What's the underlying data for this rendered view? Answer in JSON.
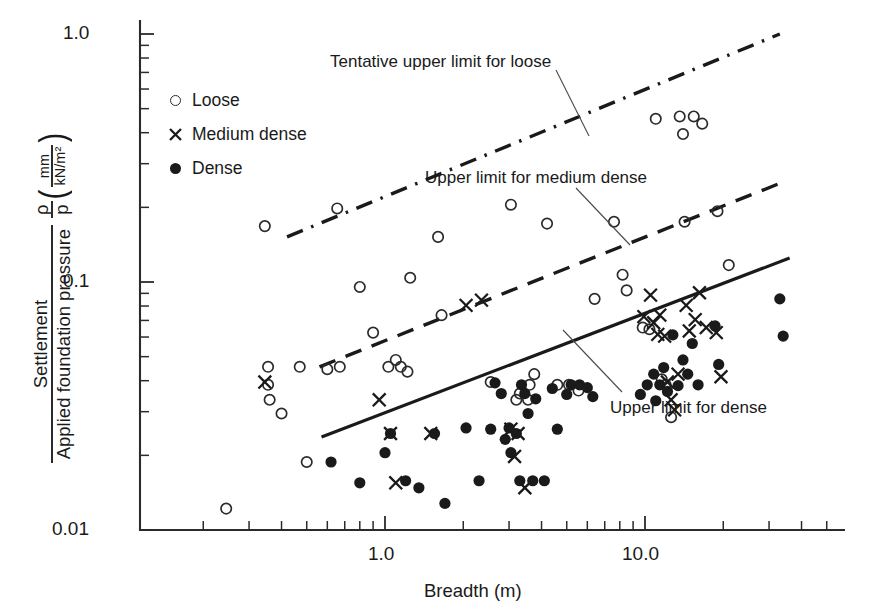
{
  "chart_data": {
    "type": "scatter",
    "title": "",
    "xlabel": "Breadth (m)",
    "ylabel": "Settlement / Applied foundation pressure",
    "ylabel_parts": {
      "numerator": "Settlement",
      "denominator": "Applied foundation pressure",
      "symbol_numerator": "ρ",
      "symbol_denominator": "p",
      "units_numerator": "mm",
      "units_denominator": "kN/m²"
    },
    "xscale": "log",
    "yscale": "log",
    "xlim": [
      0.2,
      50.0
    ],
    "ylim": [
      0.01,
      1.0
    ],
    "xticks": [
      1.0,
      10.0
    ],
    "xticklabels": [
      "1.0",
      "10.0"
    ],
    "yticks": [
      0.01,
      0.1,
      1.0
    ],
    "yticklabels": [
      "0.01",
      "0.1",
      "1.0"
    ],
    "grid": false,
    "legend_position": "upper-left-inside",
    "legend": [
      {
        "label": "Loose",
        "marker": "open-circle"
      },
      {
        "label": "Medium dense",
        "marker": "x"
      },
      {
        "label": "Dense",
        "marker": "filled-circle"
      }
    ],
    "annotations": [
      {
        "text": "Tentative upper limit for loose",
        "target_line": "tentative-upper-limit-loose"
      },
      {
        "text": "Upper limit for medium dense",
        "target_line": "upper-limit-medium-dense"
      },
      {
        "text": "Upper limit for dense",
        "target_line": "upper-limit-dense"
      }
    ],
    "lines": [
      {
        "name": "tentative-upper-limit-loose",
        "label": "Tentative upper limit for loose",
        "style": "dash-dot",
        "points": [
          [
            0.42,
            0.152
          ],
          [
            33.0,
            1.0
          ]
        ]
      },
      {
        "name": "upper-limit-medium-dense",
        "label": "Upper limit for medium dense",
        "style": "dashed",
        "points": [
          [
            0.56,
            0.0455
          ],
          [
            34.0,
            0.253
          ]
        ]
      },
      {
        "name": "upper-limit-dense",
        "label": "Upper limit for dense",
        "style": "solid",
        "points": [
          [
            0.57,
            0.0237
          ],
          [
            36.0,
            0.125
          ]
        ]
      }
    ],
    "series": [
      {
        "name": "Loose",
        "marker": "open-circle",
        "points": [
          [
            0.245,
            0.0122
          ],
          [
            0.345,
            0.168
          ],
          [
            0.355,
            0.0455
          ],
          [
            0.355,
            0.0385
          ],
          [
            0.36,
            0.0335
          ],
          [
            0.4,
            0.0295
          ],
          [
            0.47,
            0.0455
          ],
          [
            0.5,
            0.0188
          ],
          [
            0.6,
            0.0445
          ],
          [
            0.655,
            0.198
          ],
          [
            0.67,
            0.0455
          ],
          [
            0.8,
            0.0955
          ],
          [
            0.9,
            0.0625
          ],
          [
            1.03,
            0.0455
          ],
          [
            1.1,
            0.0485
          ],
          [
            1.15,
            0.0455
          ],
          [
            1.22,
            0.0435
          ],
          [
            1.25,
            0.104
          ],
          [
            1.6,
            0.152
          ],
          [
            1.65,
            0.0735
          ],
          [
            2.55,
            0.0395
          ],
          [
            3.05,
            0.205
          ],
          [
            3.2,
            0.0335
          ],
          [
            3.3,
            0.0355
          ],
          [
            3.55,
            0.0335
          ],
          [
            3.6,
            0.0385
          ],
          [
            3.75,
            0.0425
          ],
          [
            4.2,
            0.172
          ],
          [
            4.6,
            0.0385
          ],
          [
            5.1,
            0.0385
          ],
          [
            5.55,
            0.0365
          ],
          [
            6.4,
            0.0855
          ],
          [
            7.6,
            0.175
          ],
          [
            8.2,
            0.107
          ],
          [
            8.5,
            0.0925
          ],
          [
            9.8,
            0.0655
          ],
          [
            10.4,
            0.0645
          ],
          [
            11.0,
            0.455
          ],
          [
            11.6,
            0.0405
          ],
          [
            12.0,
            0.0385
          ],
          [
            12.6,
            0.0285
          ],
          [
            13.6,
            0.465
          ],
          [
            14.0,
            0.395
          ],
          [
            14.2,
            0.175
          ],
          [
            15.4,
            0.465
          ],
          [
            16.6,
            0.435
          ],
          [
            19.0,
            0.193
          ],
          [
            21.0,
            0.117
          ]
        ]
      },
      {
        "name": "Medium dense",
        "marker": "x",
        "points": [
          [
            0.345,
            0.0395
          ],
          [
            0.95,
            0.0335
          ],
          [
            1.05,
            0.0245
          ],
          [
            1.1,
            0.0155
          ],
          [
            1.5,
            0.0245
          ],
          [
            2.05,
            0.0805
          ],
          [
            2.35,
            0.0845
          ],
          [
            3.05,
            0.0255
          ],
          [
            3.15,
            0.0198
          ],
          [
            3.25,
            0.0245
          ],
          [
            3.45,
            0.0148
          ],
          [
            9.9,
            0.0725
          ],
          [
            10.5,
            0.0885
          ],
          [
            10.8,
            0.0685
          ],
          [
            11.2,
            0.0615
          ],
          [
            11.4,
            0.0735
          ],
          [
            11.9,
            0.0605
          ],
          [
            12.2,
            0.0395
          ],
          [
            12.6,
            0.0335
          ],
          [
            13.0,
            0.0305
          ],
          [
            13.4,
            0.0425
          ],
          [
            14.4,
            0.0805
          ],
          [
            14.8,
            0.0635
          ],
          [
            15.6,
            0.0705
          ],
          [
            16.2,
            0.0905
          ],
          [
            17.2,
            0.0655
          ],
          [
            18.8,
            0.0625
          ],
          [
            19.6,
            0.0415
          ]
        ]
      },
      {
        "name": "Dense",
        "marker": "filled-circle",
        "points": [
          [
            0.62,
            0.0188
          ],
          [
            0.8,
            0.0155
          ],
          [
            1.0,
            0.0205
          ],
          [
            1.05,
            0.0245
          ],
          [
            1.2,
            0.0158
          ],
          [
            1.35,
            0.0148
          ],
          [
            1.55,
            0.0245
          ],
          [
            1.7,
            0.0128
          ],
          [
            2.05,
            0.0258
          ],
          [
            2.3,
            0.0158
          ],
          [
            2.55,
            0.0255
          ],
          [
            2.65,
            0.0392
          ],
          [
            2.8,
            0.0355
          ],
          [
            2.9,
            0.0232
          ],
          [
            3.0,
            0.0258
          ],
          [
            3.05,
            0.0205
          ],
          [
            3.2,
            0.0245
          ],
          [
            3.3,
            0.0158
          ],
          [
            3.35,
            0.0385
          ],
          [
            3.45,
            0.0355
          ],
          [
            3.55,
            0.0295
          ],
          [
            3.7,
            0.0158
          ],
          [
            3.8,
            0.0338
          ],
          [
            4.1,
            0.0158
          ],
          [
            4.4,
            0.0372
          ],
          [
            4.6,
            0.0255
          ],
          [
            5.0,
            0.0352
          ],
          [
            5.2,
            0.0385
          ],
          [
            5.6,
            0.0385
          ],
          [
            6.0,
            0.0375
          ],
          [
            6.3,
            0.0345
          ],
          [
            9.6,
            0.0352
          ],
          [
            10.2,
            0.0385
          ],
          [
            10.8,
            0.0425
          ],
          [
            11.0,
            0.0332
          ],
          [
            11.4,
            0.0385
          ],
          [
            11.8,
            0.0452
          ],
          [
            12.2,
            0.0362
          ],
          [
            12.8,
            0.0612
          ],
          [
            13.4,
            0.0382
          ],
          [
            14.0,
            0.0485
          ],
          [
            14.6,
            0.0425
          ],
          [
            15.2,
            0.0565
          ],
          [
            16.0,
            0.0385
          ],
          [
            18.6,
            0.0665
          ],
          [
            19.2,
            0.0465
          ],
          [
            33.0,
            0.0855
          ],
          [
            34.0,
            0.0605
          ]
        ]
      }
    ]
  },
  "axis": {
    "y_top_label": "1.0",
    "y_mid_label": "0.1",
    "y_bot_label": "0.01",
    "x_left_label": "1.0",
    "x_right_label": "10.0",
    "x_title": "Breadth (m)",
    "y_numerator": "Settlement",
    "y_denominator": "Applied foundation pressure",
    "y_rho": "ρ",
    "y_p": "p",
    "y_unit_num": "mm",
    "y_unit_den": "kN/m²",
    "paren_open": "(",
    "paren_close": ")"
  },
  "legend": {
    "items": [
      {
        "label": "Loose"
      },
      {
        "label": "Medium dense"
      },
      {
        "label": "Dense"
      }
    ]
  },
  "annotations": {
    "loose": "Tentative upper limit for loose",
    "medium": "Upper limit for medium dense",
    "dense": "Upper limit for dense"
  }
}
